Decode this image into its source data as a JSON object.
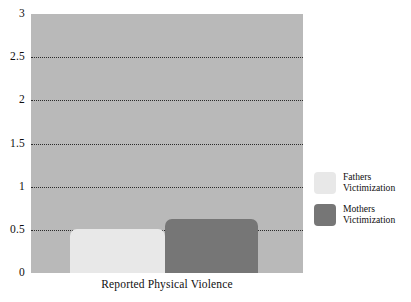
{
  "chart_data": {
    "type": "bar",
    "title": "",
    "subtitle": "",
    "xlabel": "Reported Physical Violence",
    "ylabel": "",
    "categories": [
      "Reported Physical Violence"
    ],
    "series": [
      {
        "name": "Fathers Victimization",
        "values": [
          0.51
        ],
        "color": "#e8e8e8"
      },
      {
        "name": "Mothers Victimization",
        "values": [
          0.63
        ],
        "color": "#767676"
      }
    ],
    "ylim": [
      0,
      3
    ],
    "yticks": [
      0,
      0.5,
      1,
      1.5,
      2,
      2.5,
      3
    ],
    "ytick_labels": [
      "0",
      "0.5",
      "1",
      "1.5",
      "2",
      "2.5",
      "3"
    ],
    "gridlines": [
      0.5,
      1,
      1.5,
      2,
      2.5
    ],
    "grid": true,
    "grid_style": "dotted",
    "grid_color": "#2b2b2b",
    "legend_position": "right",
    "plot_background": "#b9b9b9",
    "page_background": "#ffffff"
  },
  "axis": {
    "y_ticks": [
      {
        "label": "3",
        "value": 3
      },
      {
        "label": "2.5",
        "value": 2.5
      },
      {
        "label": "2",
        "value": 2
      },
      {
        "label": "1.5",
        "value": 1.5
      },
      {
        "label": "1",
        "value": 1
      },
      {
        "label": "0.5",
        "value": 0.5
      },
      {
        "label": "0",
        "value": 0
      }
    ],
    "x_label": "Reported Physical Violence"
  },
  "legend": {
    "items": [
      {
        "label": "Fathers\nVictimization",
        "color": "#e8e8e8"
      },
      {
        "label": "Mothers\nVictimization",
        "color": "#767676"
      }
    ]
  }
}
